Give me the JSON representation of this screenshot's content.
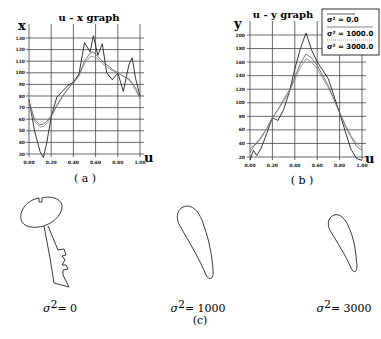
{
  "figure": {
    "caption_a": "( a )",
    "caption_b": "( b )",
    "caption_c": "(c)",
    "shapes": [
      {
        "label_sym": "σ",
        "label_exp": "2",
        "label_val": "= 0"
      },
      {
        "label_sym": "σ",
        "label_exp": "2",
        "label_val": "= 1000"
      },
      {
        "label_sym": "σ",
        "label_exp": "2",
        "label_val": "= 3000"
      }
    ]
  },
  "chart_data": [
    {
      "type": "line",
      "title": "u - x  graph",
      "xlabel": "u",
      "ylabel": "x",
      "xlim": [
        0,
        1
      ],
      "ylim": [
        30,
        130
      ],
      "grid": true,
      "x_ticks": [
        "0.00",
        "0.20",
        "0.40",
        "0.60",
        "0.80",
        "1.00"
      ],
      "y_ticks": [
        "130",
        "120",
        "110",
        "100",
        "90",
        "80",
        "70",
        "60",
        "50",
        "40",
        "30"
      ],
      "x": [
        0.0,
        0.05,
        0.1,
        0.13,
        0.16,
        0.2,
        0.25,
        0.3,
        0.35,
        0.4,
        0.45,
        0.5,
        0.55,
        0.58,
        0.62,
        0.66,
        0.7,
        0.75,
        0.8,
        0.85,
        0.9,
        0.93,
        0.96,
        1.0
      ],
      "series": [
        {
          "name": "σ² = 0.0",
          "values": [
            77,
            50,
            32,
            27,
            40,
            62,
            79,
            84,
            89,
            92,
            99,
            126,
            118,
            132,
            115,
            125,
            100,
            94,
            100,
            84,
            107,
            113,
            95,
            80
          ]
        },
        {
          "name": "σ² = 1000.0",
          "values": [
            76,
            60,
            55,
            56,
            58,
            63,
            72,
            80,
            86,
            92,
            98,
            110,
            117,
            118,
            114,
            110,
            107,
            103,
            100,
            97,
            95,
            91,
            87,
            78
          ]
        },
        {
          "name": "σ² = 3000.0",
          "values": [
            75,
            58,
            53,
            54,
            56,
            62,
            71,
            79,
            86,
            91,
            97,
            108,
            114,
            114,
            112,
            108,
            105,
            102,
            100,
            97,
            94,
            90,
            85,
            78
          ]
        }
      ]
    },
    {
      "type": "line",
      "title": "u - y  graph",
      "xlabel": "u",
      "ylabel": "y",
      "xlim": [
        0,
        1
      ],
      "ylim": [
        20,
        200
      ],
      "grid": true,
      "x_ticks": [
        "0.00",
        "0.20",
        "0.40",
        "0.60",
        "0.80",
        "1.00"
      ],
      "y_ticks": [
        "200",
        "180",
        "160",
        "140",
        "120",
        "100",
        "80",
        "60",
        "40",
        "20"
      ],
      "legend": {
        "position": "upper right",
        "entries": [
          "σ² = 0.0",
          "σ² = 1000.0",
          "σ² = 3000.0"
        ]
      },
      "x": [
        0.0,
        0.03,
        0.06,
        0.1,
        0.15,
        0.2,
        0.25,
        0.3,
        0.35,
        0.4,
        0.45,
        0.5,
        0.55,
        0.6,
        0.65,
        0.7,
        0.75,
        0.8,
        0.85,
        0.9,
        0.95,
        1.0
      ],
      "series": [
        {
          "name": "σ² = 0.0",
          "values": [
            15,
            30,
            22,
            33,
            55,
            78,
            74,
            90,
            115,
            150,
            180,
            203,
            178,
            160,
            148,
            135,
            110,
            85,
            58,
            32,
            18,
            15
          ]
        },
        {
          "name": "σ² = 1000.0",
          "values": [
            27,
            35,
            40,
            48,
            62,
            78,
            90,
            105,
            118,
            138,
            158,
            172,
            166,
            155,
            140,
            125,
            105,
            85,
            66,
            50,
            36,
            30
          ]
        },
        {
          "name": "σ² = 3000.0",
          "values": [
            32,
            37,
            42,
            50,
            62,
            78,
            90,
            102,
            116,
            134,
            152,
            165,
            160,
            150,
            136,
            122,
            104,
            86,
            68,
            52,
            40,
            34
          ]
        }
      ]
    }
  ]
}
